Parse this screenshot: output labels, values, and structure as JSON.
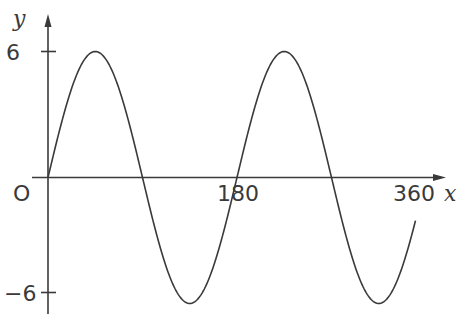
{
  "chart_data": {
    "type": "line",
    "title": "",
    "xlabel": "x",
    "ylabel": "y",
    "function": "y = 6 sin(2x)",
    "xlim": [
      0,
      360
    ],
    "ylim": [
      -6,
      6
    ],
    "x_ticks": [
      "180",
      "360"
    ],
    "y_ticks": [
      "6",
      "-6"
    ],
    "origin_label": "O",
    "grid": false,
    "series": [
      {
        "name": "curve",
        "x": [
          0,
          45,
          90,
          135,
          180,
          225,
          270,
          315,
          350
        ],
        "values": [
          0,
          6,
          0,
          -6,
          0,
          6,
          0,
          -6,
          -2.05
        ]
      }
    ]
  },
  "labels": {
    "y_axis": "y",
    "x_axis": "x",
    "origin": "O",
    "y_top": "6",
    "y_bottom": "−6",
    "x_mid": "180",
    "x_end": "360"
  },
  "colors": {
    "line": "#3a3a3a",
    "axis": "#3a3a3a"
  }
}
